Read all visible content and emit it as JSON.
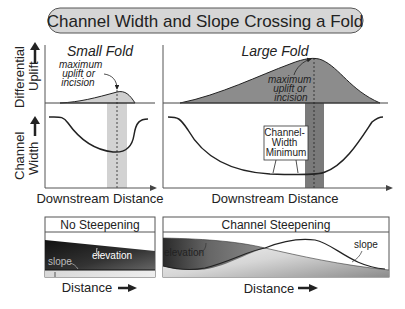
{
  "title": "Channel Width and Slope Crossing a Fold",
  "top_panels": {
    "small_fold": {
      "title": "Small Fold",
      "annotation": [
        "maximum",
        "uplift or",
        "incision"
      ],
      "xlabel": "Downstream Distance"
    },
    "large_fold": {
      "title": "Large Fold",
      "annotation": [
        "maximum",
        "uplift or",
        "incision"
      ],
      "channel_width_label": [
        "Channel-",
        "Width",
        "Minimum"
      ],
      "xlabel": "Downstream Distance"
    },
    "y_axis_uplift": [
      "Differential",
      "Uplift"
    ],
    "y_axis_width": [
      "Channel",
      "Width"
    ]
  },
  "bottom_panels": {
    "no_steepening": {
      "title": "No Steepening",
      "labels": {
        "elevation": "elevation",
        "slope": "slope"
      },
      "xlabel": "Distance"
    },
    "channel_steepening": {
      "title": "Channel Steepening",
      "labels": {
        "elevation": "elevation",
        "slope": "slope"
      },
      "xlabel": "Distance"
    }
  },
  "colors": {
    "title_bg": "#d6d6d6",
    "fold_fill_small": "#cfcfcf",
    "fold_fill_large": "#8c8c8c",
    "band_small": "#d2d2d2",
    "band_large": "#7a7a7a",
    "line": "#222222"
  }
}
